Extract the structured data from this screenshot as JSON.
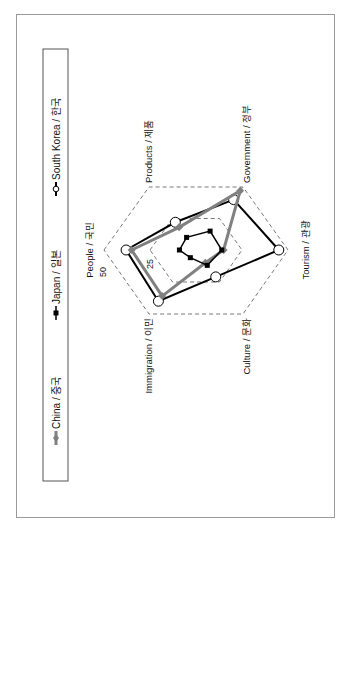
{
  "chart_data": {
    "type": "radar",
    "title": "",
    "orientation": "rotated 90° counter-clockwise",
    "axes": [
      "People / 국민",
      "Products / 제품",
      "Government / 정부",
      "Tourism / 관광",
      "Culture / 문화",
      "Immigration / 이민"
    ],
    "tick_labels": [
      "25",
      "50"
    ],
    "rlim": [
      0,
      50
    ],
    "grid": "dashed hexagons at 25 and 50",
    "legend_position": "left (top when upright)",
    "series": [
      {
        "name": "China / 중국",
        "marker": "diamond",
        "color": "#808080",
        "values": [
          35,
          18,
          47,
          15,
          10,
          36
        ]
      },
      {
        "name": "Japan / 일본",
        "marker": "square",
        "color": "#000000",
        "values": [
          9,
          10,
          15,
          14,
          12,
          6
        ]
      },
      {
        "name": "South Korea / 한국",
        "marker": "circle-open",
        "color": "#000000",
        "values": [
          38,
          22,
          40,
          45,
          21,
          40
        ]
      }
    ]
  },
  "legend": {
    "items": [
      "China / 중국",
      "Japan / 일본",
      "South Korea / 한국"
    ]
  }
}
